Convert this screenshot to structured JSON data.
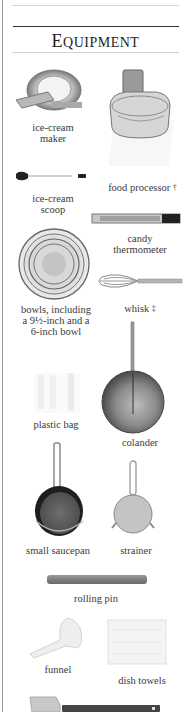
{
  "section": {
    "title": "Equipment",
    "title_first_letter": "E",
    "title_rest": "QUIPMENT"
  },
  "items": [
    {
      "id": "ice-cream-maker",
      "label_lines": [
        "ice-cream",
        "maker"
      ],
      "mark": ""
    },
    {
      "id": "food-processor",
      "label_lines": [
        "food processor"
      ],
      "mark": "†"
    },
    {
      "id": "ice-cream-scoop",
      "label_lines": [
        "ice-cream",
        "scoop"
      ],
      "mark": ""
    },
    {
      "id": "candy-thermometer",
      "label_lines": [
        "candy",
        "thermometer"
      ],
      "mark": ""
    },
    {
      "id": "bowls",
      "label_lines": [
        "bowls, including",
        "a 9½-inch and a",
        "6-inch bowl"
      ],
      "mark": ""
    },
    {
      "id": "whisk",
      "label_lines": [
        "whisk"
      ],
      "mark": "‡"
    },
    {
      "id": "plastic-bag",
      "label_lines": [
        "plastic bag"
      ],
      "mark": ""
    },
    {
      "id": "colander",
      "label_lines": [
        "colander"
      ],
      "mark": ""
    },
    {
      "id": "small-saucepan",
      "label_lines": [
        "small saucepan"
      ],
      "mark": ""
    },
    {
      "id": "strainer",
      "label_lines": [
        "strainer"
      ],
      "mark": ""
    },
    {
      "id": "rolling-pin",
      "label_lines": [
        "rolling pin"
      ],
      "mark": ""
    },
    {
      "id": "funnel",
      "label_lines": [
        "funnel"
      ],
      "mark": ""
    },
    {
      "id": "dish-towels",
      "label_lines": [
        "dish towels"
      ],
      "mark": ""
    },
    {
      "id": "spatula",
      "label_lines": [],
      "mark": ""
    }
  ],
  "colors": {
    "text": "#3a3a3a",
    "rule_dark": "#333333",
    "rule_light": "#d0d0d0",
    "metal": "#8c8c8c",
    "metal_dark": "#3d3d3d"
  }
}
